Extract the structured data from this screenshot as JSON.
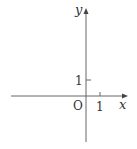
{
  "diagram": {
    "type": "coordinate-axes",
    "x_axis_label": "x",
    "y_axis_label": "y",
    "origin_label": "O",
    "x_tick_label": "1",
    "y_tick_label": "1",
    "axis_color": "#555555"
  }
}
